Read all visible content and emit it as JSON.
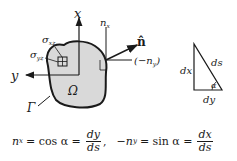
{
  "diagram": {
    "axes": {
      "x_label": "x",
      "y_label": "y"
    },
    "region": {
      "domain_label": "Ω",
      "boundary_label": "Γ",
      "fill_color": "#d9d9d9",
      "stroke_color": "#1a1a1a"
    },
    "stress_labels": {
      "sigma_xz": "σ",
      "sigma_xz_sub": "xz",
      "sigma_yz": "σ",
      "sigma_yz_sub": "yz"
    },
    "normal": {
      "label": "n̂",
      "nx_label": "n",
      "nx_sub": "x",
      "neg_ny_label": "(−n",
      "neg_ny_sub": "y",
      "neg_ny_close": ")"
    },
    "triangle": {
      "dx_label": "dx",
      "ds_label": "ds",
      "dy_label": "dy",
      "angle_label": "α"
    }
  },
  "equation": {
    "lhs1": "n",
    "lhs1_sub": "x",
    "eq1": "= cos α =",
    "frac1_num": "dy",
    "frac1_den": "ds",
    "sep": ",",
    "lhs2_prefix": "−n",
    "lhs2_sub": "y",
    "eq2": "= sin α =",
    "frac2_num": "dx",
    "frac2_den": "ds"
  }
}
